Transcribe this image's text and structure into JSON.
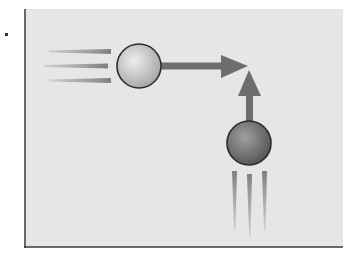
{
  "diagram": {
    "panel": {
      "background": "#e6e6e6",
      "border_color": "#3a3a3a"
    },
    "ball_horizontal": {
      "label": "",
      "color_light": "#e2e2e2",
      "color_dark": "#a8a8a8",
      "direction": "right"
    },
    "ball_vertical": {
      "label": "",
      "color_light": "#9a9a9a",
      "color_dark": "#5e5e5e",
      "direction": "up"
    },
    "arrow_color": "#6e6e6e",
    "speed_line_color": "#8a8a8a",
    "marker_dot_color": "#333333"
  }
}
